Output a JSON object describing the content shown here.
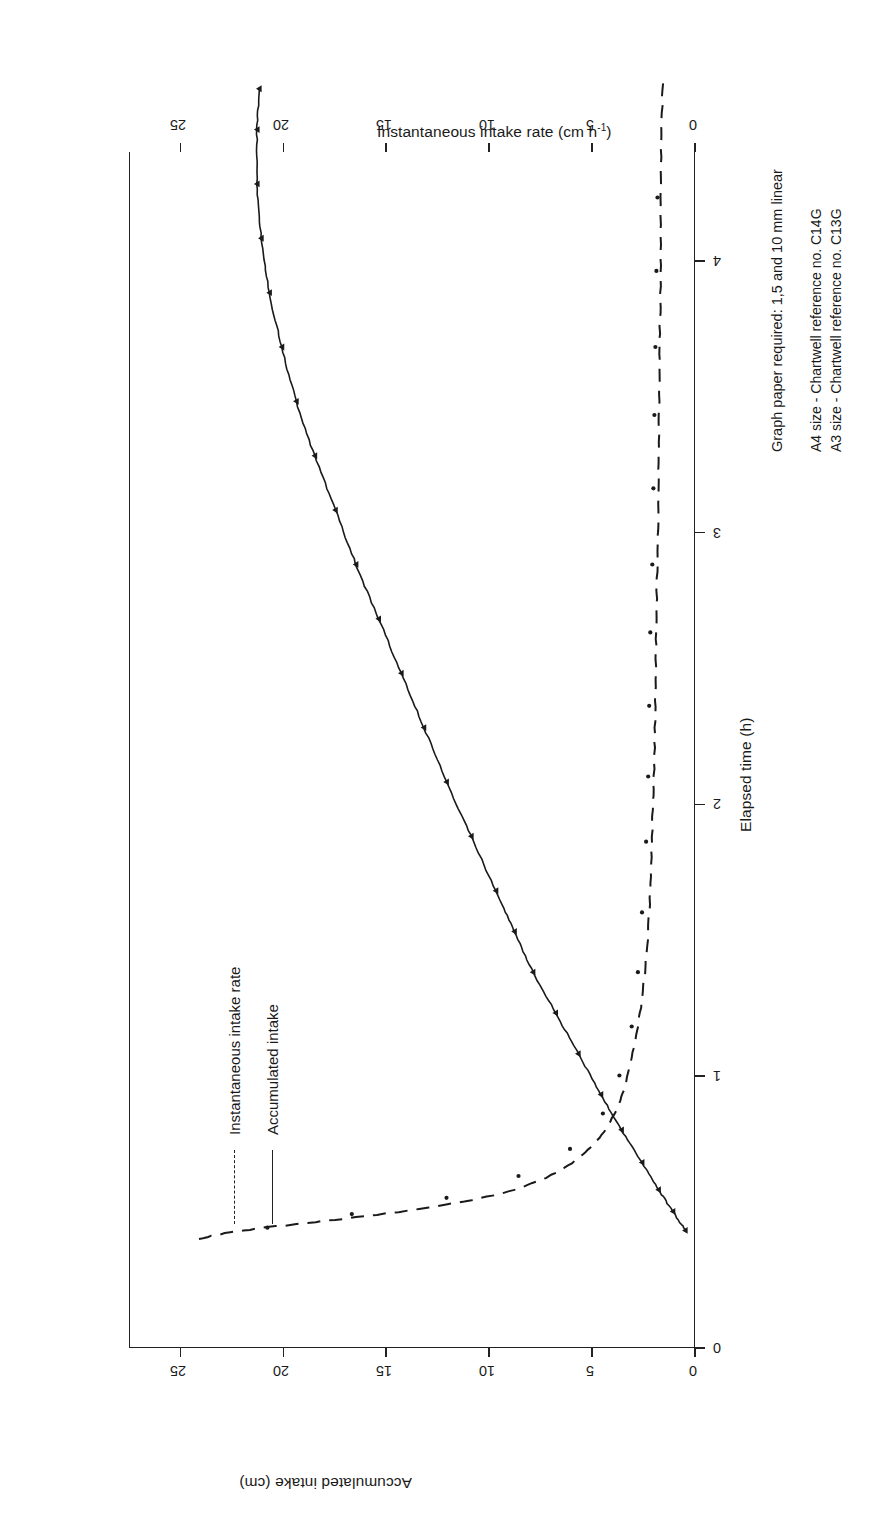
{
  "figure": {
    "axes": {
      "x": {
        "label": "Elapsed time (h)",
        "ticks": [
          "0",
          "1",
          "2",
          "3",
          "4"
        ],
        "values": [
          0,
          1,
          2,
          3,
          4
        ],
        "range": [
          0,
          4.4
        ]
      },
      "y_left": {
        "label": "Accumulated intake (cm)",
        "ticks": [
          "0",
          "5",
          "10",
          "15",
          "20",
          "25"
        ],
        "values": [
          0,
          5,
          10,
          15,
          20,
          25
        ],
        "range": [
          0,
          27.5
        ]
      },
      "y_right": {
        "label": "Instantaneous intake rate (cm h-1)",
        "label_base": "Instantaneous intake rate (cm h",
        "label_sup": "-1",
        "label_tail": ")",
        "ticks": [
          "0",
          "5",
          "10",
          "15",
          "20",
          "25"
        ],
        "values": [
          0,
          5,
          10,
          15,
          20,
          25
        ],
        "range": [
          0,
          27.5
        ]
      }
    },
    "legend": {
      "items": [
        {
          "label": "Instantaneous intake rate",
          "style": "dashed"
        },
        {
          "label": "Accumulated intake",
          "style": "solid"
        }
      ]
    },
    "notes": {
      "line1": "Graph paper required: 1,5 and 10 mm linear",
      "line2": "A4 size - Chartwell reference no. C14G",
      "line3": "A3 size - Chartwell reference no. C13G"
    },
    "colors": {
      "ink": "#1a1a1a",
      "axis": "#222222",
      "background": "#ffffff"
    }
  },
  "chart_data": {
    "type": "line",
    "title": "",
    "xlabel": "Elapsed time (h)",
    "ylabel": "Accumulated intake (cm)",
    "ylabel_secondary": "Instantaneous intake rate (cm h-1)",
    "xlim": [
      0,
      4.4
    ],
    "ylim": [
      0,
      27.5
    ],
    "ylim_secondary": [
      0,
      27.5
    ],
    "grid": false,
    "legend_position": "upper-left",
    "series": [
      {
        "name": "Accumulated intake",
        "axis": "left",
        "style": "solid",
        "marker": "small-triangle",
        "x": [
          0.05,
          0.12,
          0.2,
          0.3,
          0.42,
          0.55,
          0.7,
          0.85,
          1.0,
          1.15,
          1.3,
          1.5,
          1.7,
          1.9,
          2.1,
          2.3,
          2.5,
          2.7,
          2.9,
          3.1,
          3.3,
          3.5,
          3.7,
          3.9,
          4.1,
          4.25
        ],
        "y": [
          3.0,
          3.6,
          4.3,
          5.1,
          6.1,
          7.1,
          8.2,
          9.3,
          10.4,
          11.3,
          12.2,
          13.4,
          14.6,
          15.7,
          16.8,
          17.9,
          19.0,
          20.0,
          21.0,
          21.9,
          22.6,
          23.2,
          23.6,
          23.8,
          23.8,
          23.7
        ]
      },
      {
        "name": "Instantaneous intake rate",
        "axis": "right",
        "style": "dashed",
        "marker": "dot",
        "x": [
          0.02,
          0.05,
          0.09,
          0.14,
          0.2,
          0.28,
          0.38,
          0.5,
          0.65,
          0.85,
          1.05,
          1.3,
          1.55,
          1.8,
          2.05,
          2.3,
          2.55,
          2.8,
          3.05,
          3.3,
          3.55,
          3.8,
          4.05,
          4.3
        ],
        "y": [
          26.6,
          24.5,
          20.0,
          15.0,
          11.3,
          8.9,
          7.3,
          6.3,
          5.7,
          5.2,
          4.9,
          4.7,
          4.6,
          4.5,
          4.45,
          4.4,
          4.35,
          4.3,
          4.28,
          4.25,
          4.2,
          4.2,
          4.15,
          4.1
        ]
      }
    ],
    "scatter_points": {
      "name": "Instantaneous intake rate measurements",
      "x": [
        0.06,
        0.11,
        0.17,
        0.25,
        0.35,
        0.48,
        0.62,
        0.8,
        1.0,
        1.22,
        1.48,
        1.72,
        1.98,
        2.25,
        2.5,
        2.78,
        3.05,
        3.3,
        3.58,
        3.85
      ],
      "y": [
        23.3,
        19.2,
        14.6,
        11.1,
        8.6,
        7.0,
        6.2,
        5.6,
        5.3,
        5.1,
        4.9,
        4.8,
        4.75,
        4.7,
        4.6,
        4.55,
        4.5,
        4.45,
        4.4,
        4.35
      ]
    }
  }
}
